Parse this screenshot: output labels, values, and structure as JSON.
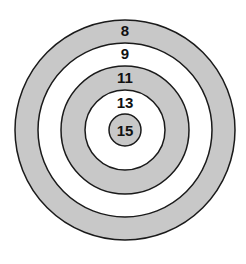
{
  "diagram": {
    "type": "target-bullseye",
    "center": {
      "x": 125,
      "y": 130
    },
    "stroke_color": "#1a1a1a",
    "rings": [
      {
        "score": "8",
        "radius": 110,
        "fill": "#c8c8c8",
        "label_y": 36
      },
      {
        "score": "9",
        "radius": 87,
        "fill": "#ffffff",
        "label_y": 58
      },
      {
        "score": "11",
        "radius": 64,
        "fill": "#c8c8c8",
        "label_y": 82
      },
      {
        "score": "13",
        "radius": 40,
        "fill": "#ffffff",
        "label_y": 107
      },
      {
        "score": "15",
        "radius": 16,
        "fill": "#c8c8c8",
        "label_y": 136
      }
    ]
  }
}
